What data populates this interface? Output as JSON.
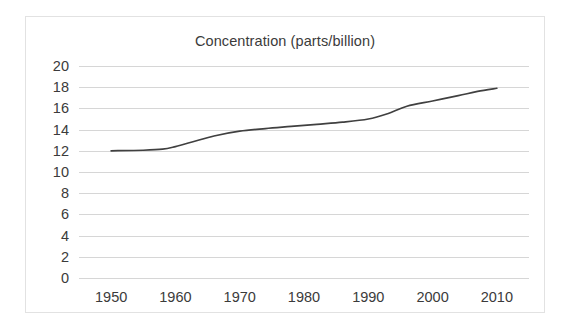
{
  "chart_data": {
    "type": "line",
    "title": "Concentration (parts/billion)",
    "xlabel": "",
    "ylabel": "",
    "xlim": [
      1945,
      2015
    ],
    "ylim": [
      0,
      20
    ],
    "grid": true,
    "legend": false,
    "line_color": "#404040",
    "grid_color": "#d6d6d6",
    "border_color": "#e2e2e2",
    "text_color": "#3b3b3b",
    "background": "#ffffff",
    "x_ticks": [
      1950,
      1960,
      1970,
      1980,
      1990,
      2000,
      2010
    ],
    "x_tick_labels": [
      "1950",
      "1960",
      "1970",
      "1980",
      "1990",
      "2000",
      "2010"
    ],
    "y_ticks": [
      0,
      2,
      4,
      6,
      8,
      10,
      12,
      14,
      16,
      18,
      20
    ],
    "y_tick_labels": [
      "0",
      "2",
      "4",
      "6",
      "8",
      "10",
      "12",
      "14",
      "16",
      "18",
      "20"
    ],
    "series": [
      {
        "name": "Concentration",
        "x": [
          1950,
          1955,
          1958,
          1960,
          1963,
          1966,
          1970,
          1974,
          1978,
          1982,
          1986,
          1990,
          1993,
          1996,
          2000,
          2004,
          2007,
          2010
        ],
        "values": [
          12.0,
          12.05,
          12.15,
          12.4,
          12.9,
          13.4,
          13.85,
          14.1,
          14.3,
          14.5,
          14.7,
          15.0,
          15.5,
          16.2,
          16.7,
          17.2,
          17.6,
          17.9
        ]
      }
    ]
  }
}
